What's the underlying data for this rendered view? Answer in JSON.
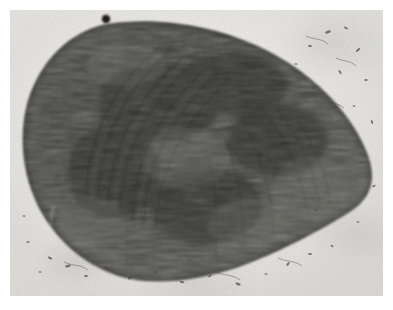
{
  "figure": {
    "kind": "electron-micrograph",
    "modality": "transmission electron microscopy",
    "rendering": "grayscale halftone print plate",
    "caption": "",
    "title": "",
    "label": "",
    "scale_bar": "",
    "magnification": "",
    "visible_text": []
  },
  "page": {
    "background_color": "#ffffff",
    "margin_px": 10
  },
  "plate": {
    "x": 10,
    "y": 10,
    "width": 373,
    "height": 286,
    "background_color": "#eeedea",
    "background_tone": "near-white pale gray emulsion",
    "grain": "fine photographic grain throughout"
  },
  "specimen": {
    "name": "dense ovoid organelle section",
    "shape": "asymmetric ovoid / teardrop, broad at left, tapering to a blunt point at right",
    "fill_dark": "#2a2a28",
    "fill_mid": "#4a4a46",
    "fill_light": "#6e6e68",
    "texture": "dense fibrous striations with curved concentric sweeps in the left-central region and finer granular packing toward the right and lower margins",
    "edge": "soft feathered boundary, sharpest along the lower-left rim",
    "bounds": {
      "left": 22,
      "top": 22,
      "right": 370,
      "bottom": 280
    },
    "center": {
      "x": 192,
      "y": 150
    }
  },
  "features": [
    {
      "name": "dark-spot",
      "description": "prominent opaque round dot on the upper rim of the mass",
      "x": 106,
      "y": 19,
      "r": 4.2,
      "color": "#141312"
    },
    {
      "name": "pale-streak",
      "description": "thin pale curved crack or fold artifact near the lower-left rim",
      "x": 50,
      "y": 218
    },
    {
      "name": "striation-sweep",
      "description": "arc of curved fibre striations sweeping from upper-centre toward lower-left",
      "x": 150,
      "y": 140
    }
  ],
  "colors": {
    "page": "#ffffff",
    "background": "#eeedea",
    "specimen_dark": "#2a2a28",
    "specimen_mid": "#4a4a46",
    "debris": "#4a4845"
  }
}
